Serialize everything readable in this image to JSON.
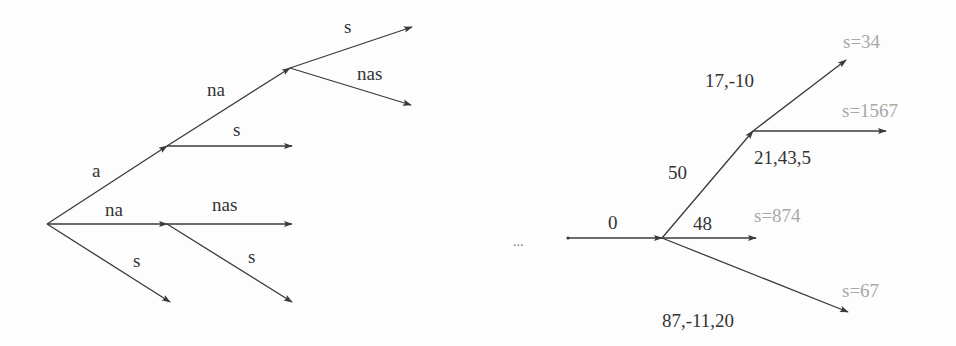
{
  "colors": {
    "edge": "#3a3a3a",
    "label": "#333333",
    "leaf_label": "#a8a8a8",
    "background": "#fdfdfd"
  },
  "left_tree": {
    "nodes": [
      {
        "id": "root",
        "x": 47,
        "y": 224
      },
      {
        "id": "a",
        "x": 167,
        "y": 146
      },
      {
        "id": "a_na",
        "x": 290,
        "y": 68
      },
      {
        "id": "na",
        "x": 167,
        "y": 224
      }
    ],
    "edges": [
      {
        "from": [
          47,
          224
        ],
        "to": [
          167,
          146
        ],
        "label": "a",
        "lx": 92,
        "ly": 177
      },
      {
        "from": [
          167,
          146
        ],
        "to": [
          290,
          68
        ],
        "label": "na",
        "lx": 207,
        "ly": 96
      },
      {
        "from": [
          290,
          68
        ],
        "to": [
          412,
          27
        ],
        "label": "s",
        "lx": 344,
        "ly": 33
      },
      {
        "from": [
          290,
          68
        ],
        "to": [
          411,
          105
        ],
        "label": "nas",
        "lx": 357,
        "ly": 80
      },
      {
        "from": [
          167,
          146
        ],
        "to": [
          292,
          146
        ],
        "label": "s",
        "lx": 233,
        "ly": 136
      },
      {
        "from": [
          47,
          224
        ],
        "to": [
          167,
          224
        ],
        "label": "na",
        "lx": 105,
        "ly": 216
      },
      {
        "from": [
          167,
          224
        ],
        "to": [
          292,
          224
        ],
        "label": "nas",
        "lx": 212,
        "ly": 211
      },
      {
        "from": [
          167,
          224
        ],
        "to": [
          292,
          302
        ],
        "label": "s",
        "lx": 248,
        "ly": 263
      },
      {
        "from": [
          47,
          224
        ],
        "to": [
          170,
          302
        ],
        "label": "s",
        "lx": 133,
        "ly": 267
      }
    ]
  },
  "ellipsis": {
    "text": "...",
    "x": 513,
    "y": 246
  },
  "right_tree": {
    "start": {
      "x": 568,
      "y": 238
    },
    "edges": [
      {
        "from": [
          568,
          238
        ],
        "to": [
          662,
          238
        ],
        "label": "0",
        "lx": 608,
        "ly": 229
      },
      {
        "from": [
          662,
          238
        ],
        "to": [
          753,
          131
        ],
        "label": "50",
        "lx": 668,
        "ly": 179
      },
      {
        "from": [
          753,
          131
        ],
        "to": [
          846,
          60
        ],
        "label": "17,-10",
        "lx": 705,
        "ly": 87
      },
      {
        "from": [
          753,
          131
        ],
        "to": [
          886,
          131
        ],
        "label": "21,43,5",
        "lx": 754,
        "ly": 164
      },
      {
        "from": [
          662,
          238
        ],
        "to": [
          756,
          238
        ],
        "label": "48",
        "lx": 693,
        "ly": 230
      },
      {
        "from": [
          662,
          238
        ],
        "to": [
          848,
          312
        ],
        "label": "87,-11,20",
        "lx": 662,
        "ly": 327
      }
    ],
    "leaf_labels": [
      {
        "text": "s=34",
        "x": 843,
        "y": 48
      },
      {
        "text": "s=1567",
        "x": 842,
        "y": 117
      },
      {
        "text": "s=874",
        "x": 754,
        "y": 222
      },
      {
        "text": "s=67",
        "x": 842,
        "y": 297
      }
    ]
  }
}
